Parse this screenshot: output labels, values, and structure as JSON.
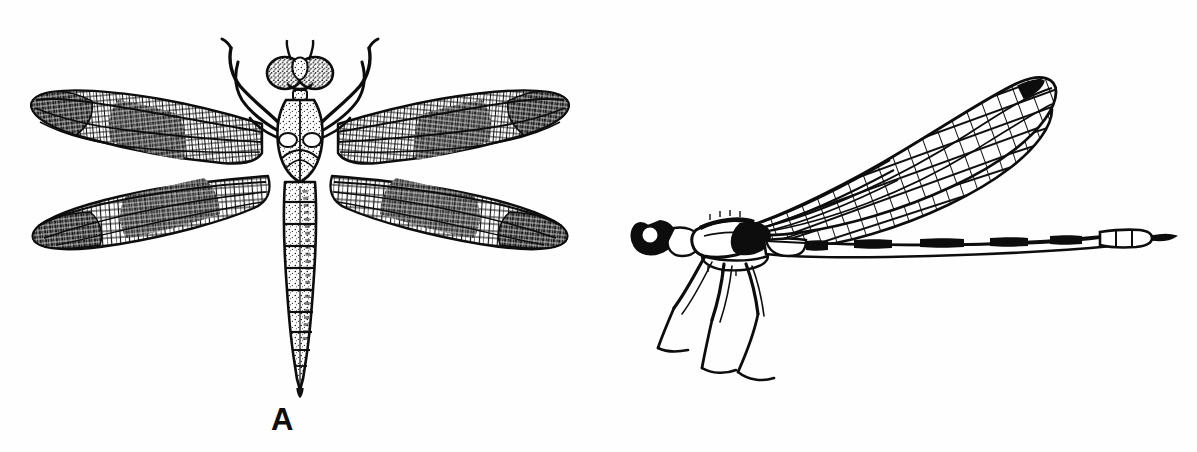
{
  "figure": {
    "background_color": "#fefefe",
    "ink_color": "#0d0d0d",
    "width": 1197,
    "height": 452,
    "style": "black-and-white scientific line illustration"
  },
  "panels": [
    {
      "id": "a",
      "label": "A",
      "subject": "dragonfly",
      "order_common_name": "Anisoptera",
      "view": "dorsal",
      "label_position": {
        "x": 271,
        "y": 404
      },
      "features": {
        "wings": "four broad wings spread horizontally, dense reticulate venation, dark pigmented basal and apical patches",
        "wing_count": 4,
        "eyes": "large compound eyes meeting at top of head",
        "abdomen": "stout segmented abdomen tapering to a point",
        "abdomen_segments": 9,
        "legs": "six legs curving forward and upward past the head",
        "thorax": "robust stippled thorax"
      }
    },
    {
      "id": "b",
      "label": "B",
      "subject": "damselfly",
      "order_common_name": "Zygoptera",
      "view": "lateral",
      "label_position": {
        "x": 826,
        "y": 404
      },
      "features": {
        "wings": "narrow stalked wings held together above the back, open rectangular venation, dark pterostigma near each wing tip",
        "wing_count": 4,
        "pterostigma_count": 2,
        "eyes": "rounded compound eye set widely on side of head",
        "abdomen": "very long slender abdomen with dark segment joints",
        "abdomen_segments": 10,
        "legs": "six long slender legs directed downward",
        "thorax": "slim elongate thorax"
      }
    }
  ],
  "icons": {
    "dragonfly": "dragonfly-illustration",
    "damselfly": "damselfly-illustration"
  }
}
